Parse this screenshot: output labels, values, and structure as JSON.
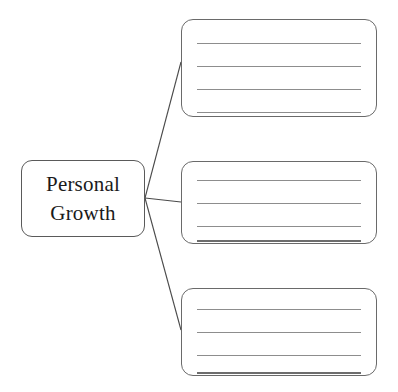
{
  "page": {
    "kind": "graphic-organizer-worksheet",
    "background_color": "#ffffff",
    "line_color": "#8d8d8d",
    "border_color": "#5a5a5a",
    "text_color": "#1a1a1a"
  },
  "topic": {
    "name": "personal-growth",
    "lines": [
      "Personal",
      "Growth"
    ]
  },
  "branches": [
    {
      "id": "branch-1",
      "blank_lines": 4,
      "line_values": [
        "",
        "",
        "",
        ""
      ],
      "placeholder": ""
    },
    {
      "id": "branch-2",
      "blank_lines": 4,
      "line_values": [
        "",
        "",
        "",
        ""
      ],
      "placeholder": ""
    },
    {
      "id": "branch-3",
      "blank_lines": 4,
      "line_values": [
        "",
        "",
        "",
        ""
      ],
      "placeholder": ""
    }
  ],
  "connectors": [
    {
      "id": "connector-1",
      "from": [
        145,
        198
      ],
      "to": [
        181,
        62
      ]
    },
    {
      "id": "connector-2",
      "from": [
        145,
        198
      ],
      "to": [
        181,
        202
      ]
    },
    {
      "id": "connector-3",
      "from": [
        145,
        198
      ],
      "to": [
        181,
        330
      ]
    }
  ]
}
